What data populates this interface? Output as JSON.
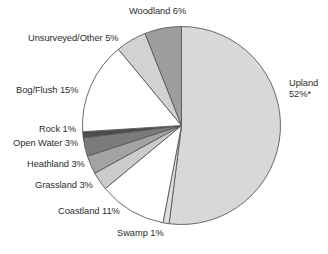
{
  "chart_data": {
    "type": "pie",
    "title": "",
    "subtitle": "",
    "xlabel": "",
    "ylabel": "",
    "legend_position": "none",
    "grid": false,
    "unit": "%",
    "note": "* asterisk appears after the Upland 52% value",
    "categories": [
      "Upland",
      "Swamp",
      "Coastland",
      "Grassland",
      "Heathland",
      "Open Water",
      "Rock",
      "Bog/Flush",
      "Unsurveyed/Other",
      "Woodland"
    ],
    "values": [
      52,
      1,
      11,
      3,
      3,
      3,
      1,
      15,
      5,
      6
    ],
    "slices": [
      {
        "name": "Upland",
        "value": 52,
        "label": "Upland",
        "value_label": "52%*",
        "full_label": "Upland 52%*",
        "color": "#d8d8d8",
        "start_angle": 0,
        "end_angle": 187.2
      },
      {
        "name": "Swamp",
        "value": 1,
        "label": "Swamp",
        "value_label": "1%",
        "full_label": "Swamp 1%",
        "color": "#dedede",
        "start_angle": 187.2,
        "end_angle": 190.8
      },
      {
        "name": "Coastland",
        "value": 11,
        "label": "Coastland",
        "value_label": "11%",
        "full_label": "Coastland 11%",
        "color": "#ffffff",
        "start_angle": 190.8,
        "end_angle": 230.4
      },
      {
        "name": "Grassland",
        "value": 3,
        "label": "Grassland",
        "value_label": "3%",
        "full_label": "Grassland 3%",
        "color": "#cbcbcb",
        "start_angle": 230.4,
        "end_angle": 241.2
      },
      {
        "name": "Heathland",
        "value": 3,
        "label": "Heathland",
        "value_label": "3%",
        "full_label": "Heathland 3%",
        "color": "#a3a3a3",
        "start_angle": 241.2,
        "end_angle": 252.0
      },
      {
        "name": "Open Water",
        "value": 3,
        "label": "Open Water",
        "value_label": "3%",
        "full_label": "Open Water 3%",
        "color": "#7b7b7b",
        "start_angle": 252.0,
        "end_angle": 262.8
      },
      {
        "name": "Rock",
        "value": 1,
        "label": "Rock",
        "value_label": "1%",
        "full_label": "Rock 1%",
        "color": "#4c4c4c",
        "start_angle": 262.8,
        "end_angle": 266.4
      },
      {
        "name": "Bog/Flush",
        "value": 15,
        "label": "Bog/Flush",
        "value_label": "15%",
        "full_label": "Bog/Flush 15%",
        "color": "#ffffff",
        "start_angle": 266.4,
        "end_angle": 320.4
      },
      {
        "name": "Unsurveyed/Other",
        "value": 5,
        "label": "Unsurveyed/Other",
        "value_label": "5%",
        "full_label": "Unsurveyed/Other 5%",
        "color": "#d2d2d2",
        "start_angle": 320.4,
        "end_angle": 338.4
      },
      {
        "name": "Woodland",
        "value": 6,
        "label": "Woodland",
        "value_label": "6%",
        "full_label": "Woodland 6%",
        "color": "#9d9d9d",
        "start_angle": 338.4,
        "end_angle": 360
      }
    ]
  },
  "labels": {
    "woodland": "Woodland 6%",
    "unsurveyed_other": "Unsurveyed/Other 5%",
    "bog_flush": "Bog/Flush 15%",
    "rock": "Rock 1%",
    "open_water": "Open Water 3%",
    "heathland": "Heathland 3%",
    "grassland": "Grassland 3%",
    "coastland": "Coastland 11%",
    "swamp": "Swamp 1%",
    "upland_line1": "Upland",
    "upland_line2": "52%*"
  }
}
